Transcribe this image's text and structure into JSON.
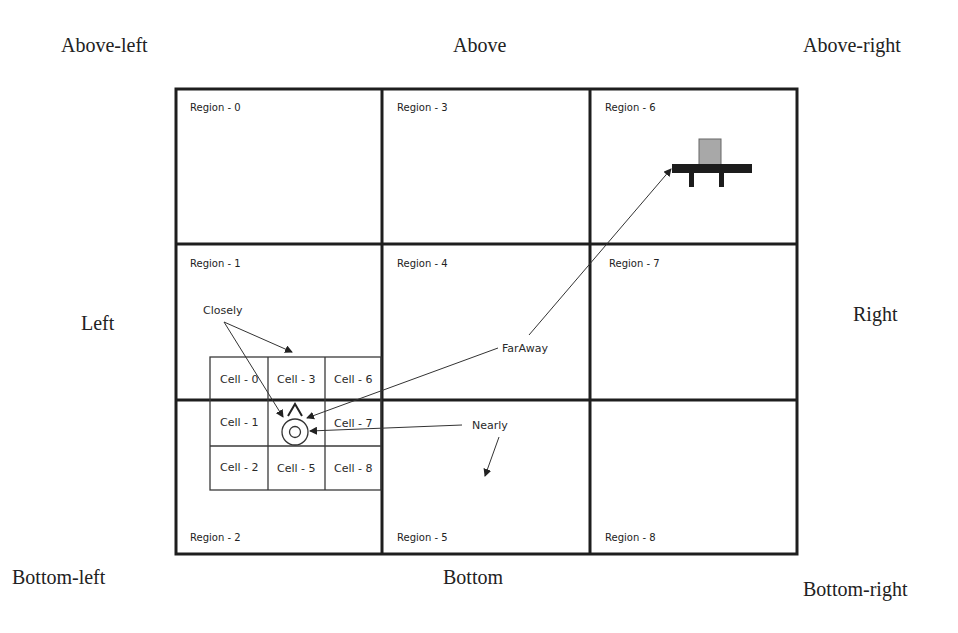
{
  "directions": {
    "above_left": "Above-left",
    "above": "Above",
    "above_right": "Above-right",
    "left": "Left",
    "right": "Right",
    "bottom_left": "Bottom-left",
    "bottom": "Bottom",
    "bottom_right": "Bottom-right"
  },
  "regions": [
    {
      "id": 0,
      "label": "Region - 0"
    },
    {
      "id": 1,
      "label": "Region - 1"
    },
    {
      "id": 2,
      "label": "Region - 2"
    },
    {
      "id": 3,
      "label": "Region - 3"
    },
    {
      "id": 4,
      "label": "Region - 4"
    },
    {
      "id": 5,
      "label": "Region - 5"
    },
    {
      "id": 6,
      "label": "Region - 6"
    },
    {
      "id": 7,
      "label": "Region - 7"
    },
    {
      "id": 8,
      "label": "Region - 8"
    }
  ],
  "cells": [
    {
      "id": 0,
      "label": "Cell - 0"
    },
    {
      "id": 1,
      "label": "Cell - 1"
    },
    {
      "id": 2,
      "label": "Cell - 2"
    },
    {
      "id": 3,
      "label": "Cell - 3"
    },
    {
      "id": 4,
      "label": ""
    },
    {
      "id": 5,
      "label": "Cell - 5"
    },
    {
      "id": 6,
      "label": "Cell - 6"
    },
    {
      "id": 7,
      "label": "Cell - 7"
    },
    {
      "id": 8,
      "label": "Cell - 8"
    }
  ],
  "callouts": {
    "closely": "Closely",
    "faraway": "FarAway",
    "nearly": "Nearly"
  },
  "icons": {
    "target": "target-circle-icon",
    "heading": "heading-triangle-icon",
    "object": "table-object-icon"
  },
  "colors": {
    "line": "#1e1e1e",
    "object_top": "#a8a8a8",
    "object_base": "#1c1c1c"
  }
}
